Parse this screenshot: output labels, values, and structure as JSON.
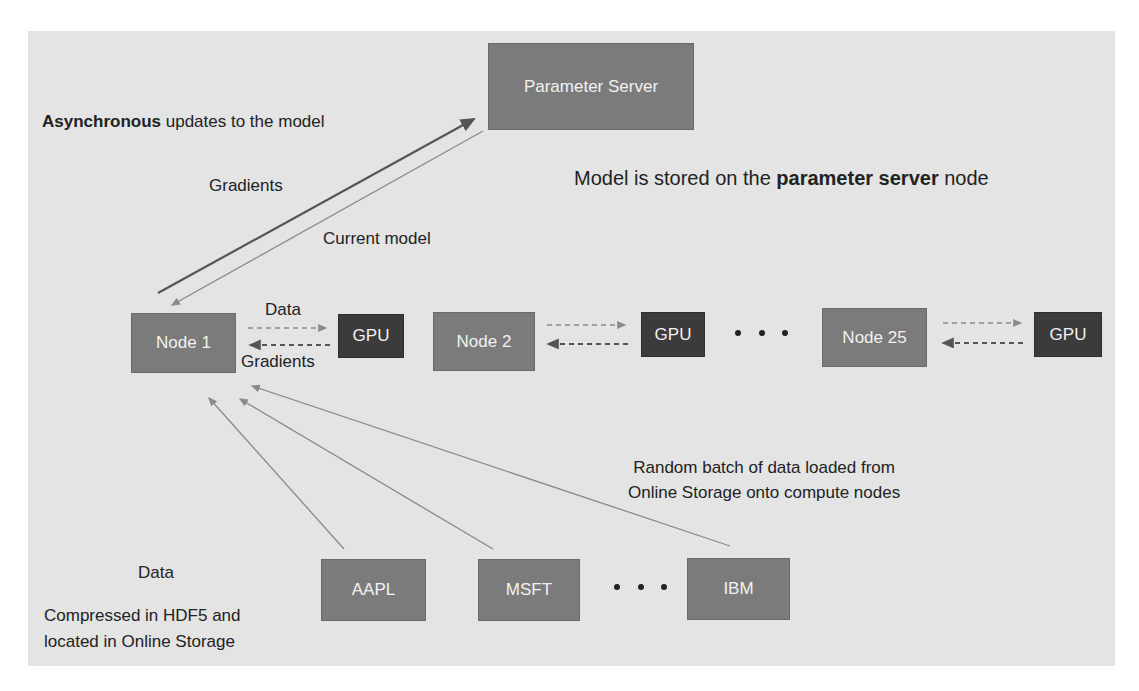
{
  "parameter_server": {
    "label": "Parameter Server"
  },
  "annotations": {
    "async_bold": "Asynchronous",
    "async_rest": " updates to the model",
    "model_stored_pre": "Model is stored on the ",
    "model_stored_bold": "parameter server",
    "model_stored_post": " node",
    "gradients_up": "Gradients",
    "current_model": "Current model",
    "data_to_gpu": "Data",
    "gradients_from_gpu": "Gradients",
    "random_batch_line1": "Random batch of data loaded from",
    "random_batch_line2": "Online Storage onto compute nodes",
    "data_title": "Data",
    "storage_line1": "Compressed in HDF5 and",
    "storage_line2": "located in Online Storage"
  },
  "compute_nodes": [
    {
      "label": "Node 1",
      "gpu": "GPU"
    },
    {
      "label": "Node 2",
      "gpu": "GPU"
    },
    {
      "label": "Node 25",
      "gpu": "GPU"
    }
  ],
  "data_stores": [
    {
      "label": "AAPL"
    },
    {
      "label": "MSFT"
    },
    {
      "label": "IBM"
    }
  ],
  "ellipsis": "...",
  "colors": {
    "background": "#e4e4e4",
    "node": "#7b7b7b",
    "gpu": "#3b3b3b",
    "arrow_dark": "#555555",
    "arrow_light": "#8a8a8a"
  }
}
